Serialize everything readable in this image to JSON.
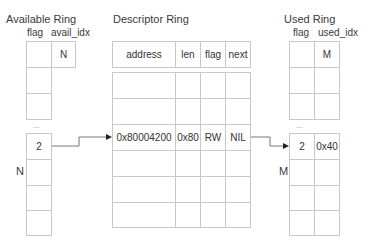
{
  "available_ring": {
    "title": "Available Ring",
    "col_flag": "flag",
    "col_idx": "avail_idx",
    "idx_value": "N",
    "ellipsis": "...",
    "entry_value": "2",
    "side_label": "N"
  },
  "descriptor_ring": {
    "title": "Descriptor Ring",
    "headers": [
      "address",
      "len",
      "flag",
      "next"
    ],
    "entry": [
      "0x80004200",
      "0x80",
      "RW",
      "NIL"
    ]
  },
  "used_ring": {
    "title": "Used Ring",
    "col_flag": "flag",
    "col_idx": "used_idx",
    "idx_value": "M",
    "ellipsis": "...",
    "entry_id": "2",
    "entry_len": "0x40",
    "side_label": "M"
  },
  "colors": {
    "line": "#c8c8c8",
    "arrow": "#555555",
    "text": "#333333"
  }
}
